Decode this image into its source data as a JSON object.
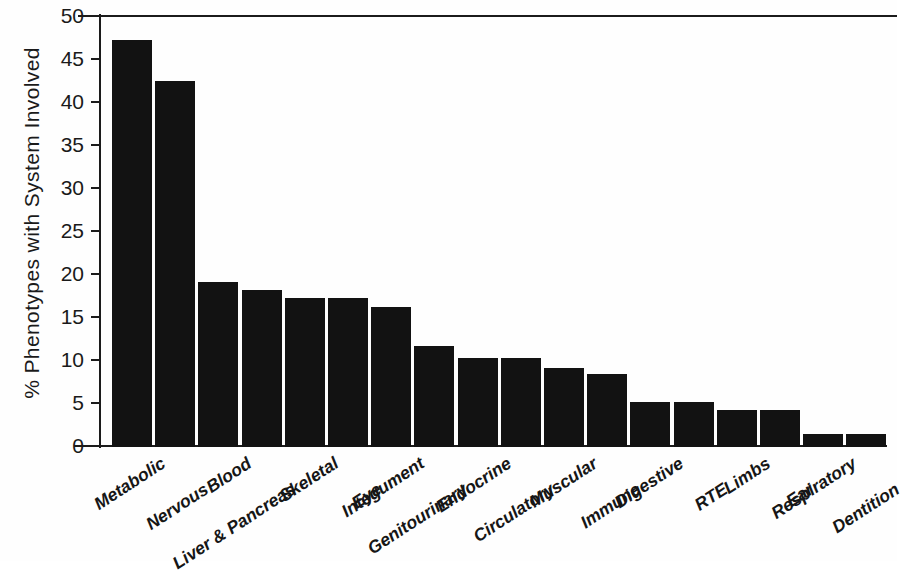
{
  "chart_data": {
    "type": "bar",
    "title": "",
    "subtitle": "",
    "xlabel": "",
    "ylabel": "% Phenotypes with System Involved",
    "ylim": [
      0,
      50
    ],
    "yticks": [
      0,
      5,
      10,
      15,
      20,
      25,
      30,
      35,
      40,
      45,
      50
    ],
    "ytick_labels": [
      "0",
      "5",
      "10",
      "15",
      "20",
      "25",
      "30",
      "35",
      "40",
      "45",
      "50"
    ],
    "grid": false,
    "legend": null,
    "bar_color": "#121212",
    "axis_color": "#1b1b1b",
    "background_color": "#fefefe",
    "categories": [
      "Metabolic",
      "Nervous",
      "Blood",
      "Liver & Pancreas",
      "Skeletal",
      "Eye",
      "Integument",
      "Genitourinary",
      "Endocrine",
      "Circulatory",
      "Muscular",
      "Immune",
      "Digestive",
      "RTE",
      "Limbs",
      "Ear",
      "Respiratory",
      "Dentition"
    ],
    "values": [
      47.3,
      42.6,
      19.2,
      18.3,
      17.3,
      17.3,
      16.3,
      11.8,
      10.3,
      10.3,
      9.2,
      8.5,
      5.2,
      5.2,
      4.3,
      4.3,
      1.5,
      1.5
    ]
  }
}
